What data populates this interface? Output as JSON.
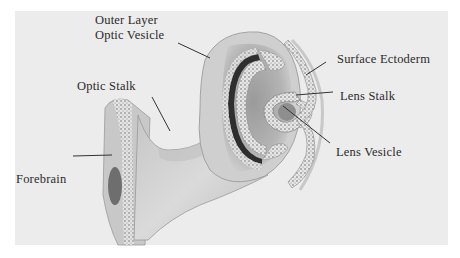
{
  "diagram": {
    "type": "anatomical-illustration",
    "labels": {
      "outer_layer_line1": "Outer  Layer",
      "outer_layer_line2": "Optic Vesicle",
      "optic_stalk": "Optic  Stalk",
      "forebrain": "Forebrain",
      "surface_ectoderm": "Surface Ectoderm",
      "lens_stalk": "Lens  Stalk",
      "lens_vesicle": "Lens Vesicle"
    },
    "colors": {
      "background": "#ffffff",
      "panel": "#ececec",
      "tissue": "#d0d0d0",
      "tissue_dark": "#a8a8a8",
      "pigment": "#2e2e2e",
      "leader_line": "#333333"
    }
  }
}
